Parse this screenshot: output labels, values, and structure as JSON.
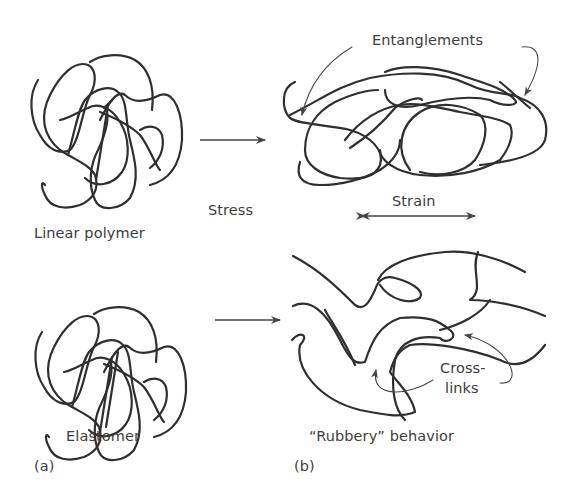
{
  "figure": {
    "labels": {
      "linear_polymer": "Linear polymer",
      "elastomer": "Elastomer",
      "stress": "Stress",
      "strain": "Strain",
      "entanglements": "Entanglements",
      "cross_links_1": "Cross-",
      "cross_links_2": "links",
      "rubbery": "“Rubbery” behavior",
      "panel_a": "(a)",
      "panel_b": "(b)"
    },
    "colors": {
      "stroke": "#2f2f2f",
      "text": "#3d3d3d",
      "background": "#ffffff"
    }
  }
}
